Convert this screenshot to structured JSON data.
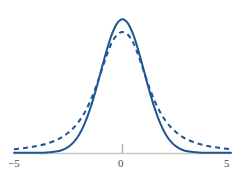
{
  "chart_data": {
    "type": "line",
    "title": "",
    "subtitle": "",
    "xlabel": "",
    "ylabel": "",
    "xlim": [
      -5,
      5
    ],
    "ylim": [
      0,
      0.42
    ],
    "grid": false,
    "legend_position": "none",
    "x_ticks": [
      -5,
      0,
      5
    ],
    "x_tick_labels": [
      "−5",
      "0",
      "5"
    ],
    "y_ticks": [],
    "y_tick_labels": [],
    "axis_color": "#c8c8c8",
    "tick_color": "#b0b0b0",
    "series": [
      {
        "name": "normal",
        "style": "solid",
        "color": "#1f5591",
        "linewidth": 2.0,
        "description": "standard normal density, peak 0.399 at x=0",
        "x": [
          -5,
          -4.5,
          -4,
          -3.5,
          -3,
          -2.75,
          -2.5,
          -2.25,
          -2,
          -1.75,
          -1.5,
          -1.25,
          -1,
          -0.75,
          -0.5,
          -0.25,
          0,
          0.25,
          0.5,
          0.75,
          1,
          1.25,
          1.5,
          1.75,
          2,
          2.25,
          2.5,
          2.75,
          3,
          3.5,
          4,
          4.5,
          5
        ],
        "y": [
          1.5e-06,
          1.6e-05,
          0.0001338,
          0.0008727,
          0.0044318,
          0.0090937,
          0.0175283,
          0.031658,
          0.053991,
          0.0862773,
          0.1295176,
          0.1826491,
          0.2419707,
          0.3011374,
          0.3520653,
          0.3866681,
          0.3989423,
          0.3866681,
          0.3520653,
          0.3011374,
          0.2419707,
          0.1826491,
          0.1295176,
          0.0862773,
          0.053991,
          0.031658,
          0.0175283,
          0.0090937,
          0.0044318,
          0.0008727,
          0.0001338,
          1.6e-05,
          1.5e-06
        ]
      },
      {
        "name": "heavy-tailed",
        "style": "dashed",
        "color": "#1f5591",
        "linewidth": 2.0,
        "dash_pattern": "5 4",
        "description": "Student t (~2 df) density, peak 0.29 at x=0, fatter tails",
        "x": [
          -5,
          -4.5,
          -4,
          -3.5,
          -3,
          -2.75,
          -2.5,
          -2.25,
          -2,
          -1.75,
          -1.5,
          -1.25,
          -1,
          -0.75,
          -0.5,
          -0.25,
          0,
          0.25,
          0.5,
          0.75,
          1,
          1.25,
          1.5,
          1.75,
          2,
          2.25,
          2.5,
          2.75,
          3,
          3.5,
          4,
          4.5,
          5
        ],
        "y": [
          0.0108,
          0.0143,
          0.0194,
          0.0271,
          0.0393,
          0.0482,
          0.0598,
          0.0748,
          0.0945,
          0.1198,
          0.1522,
          0.1924,
          0.239,
          0.2872,
          0.3281,
          0.3524,
          0.3608,
          0.3524,
          0.3281,
          0.2872,
          0.239,
          0.1924,
          0.1522,
          0.1198,
          0.0945,
          0.0748,
          0.0598,
          0.0482,
          0.0393,
          0.0271,
          0.0194,
          0.0143,
          0.0108
        ]
      }
    ],
    "annotations": []
  },
  "axis": {
    "left_label": "−5",
    "mid_label": "0",
    "right_label": "5"
  },
  "footer": {
    "clipped_caption": ""
  }
}
